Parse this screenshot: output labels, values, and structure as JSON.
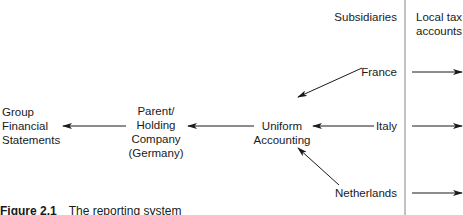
{
  "header": {
    "subsidiaries": "Subsidiaries",
    "local_tax_line1": "Local tax",
    "local_tax_line2": "accounts"
  },
  "nodes": {
    "group_fs": [
      "Group",
      "Financial",
      "Statements"
    ],
    "parent": [
      "Parent/",
      "Holding",
      "Company",
      "(Germany)"
    ],
    "uniform": [
      "Uniform",
      "Accounting"
    ],
    "france": "France",
    "italy": "Italy",
    "netherlands": "Netherlands"
  },
  "caption": {
    "number": "Figure 2.1",
    "text": "The reporting system"
  },
  "colors": {
    "line": "#1a1a1a",
    "divider": "#999999"
  }
}
